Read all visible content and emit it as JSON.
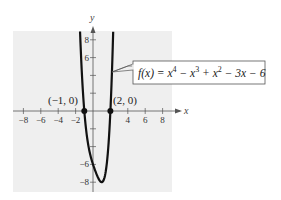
{
  "chart_data": {
    "type": "line",
    "title": "",
    "function_label": "f(x) = x^4 - x^3 + x^2 - 3x - 6",
    "function_label_parts": {
      "lhs": "f(x) = x",
      "exp4": "4",
      "m1": " − x",
      "exp3": "3",
      "m2": " + x",
      "exp2": "2",
      "tail": " − 3x − 6"
    },
    "xlabel": "x",
    "ylabel": "y",
    "xlim": [
      -9,
      9
    ],
    "ylim": [
      -9,
      9
    ],
    "grid": false,
    "x_ticks": [
      -8,
      -6,
      -4,
      -2,
      2,
      4,
      6,
      8
    ],
    "x_tick_labels": [
      "−8",
      "−6",
      "−4",
      "−2",
      "4",
      "6",
      "8"
    ],
    "x_tick_label_values": [
      -8,
      -6,
      -4,
      -2,
      4,
      6,
      8
    ],
    "y_ticks": [
      -8,
      -6,
      -4,
      -2,
      2,
      4,
      6,
      8
    ],
    "y_tick_labels": [
      "8",
      "6",
      "−6",
      "−8"
    ],
    "y_tick_label_values": [
      8,
      6,
      -6,
      -8
    ],
    "series": [
      {
        "name": "f(x) = x^4 - x^3 + x^2 - 3x - 6",
        "x": [
          -1.49,
          -1.25,
          -1,
          -0.5,
          0,
          0.5,
          1,
          1.5,
          2,
          2.2,
          2.32
        ],
        "y": [
          9,
          3.7,
          0,
          -4.06,
          -6,
          -7.31,
          -8,
          -6.56,
          0,
          5.02,
          8.9
        ]
      }
    ],
    "points": [
      {
        "x": -1,
        "y": 0,
        "label": "(−1, 0)"
      },
      {
        "x": 2,
        "y": 0,
        "label": "(2, 0)"
      }
    ],
    "annotations": [
      "(−1, 0)",
      "(2, 0)",
      "f(x) = x^4 − x^3 + x^2 − 3x − 6"
    ]
  }
}
